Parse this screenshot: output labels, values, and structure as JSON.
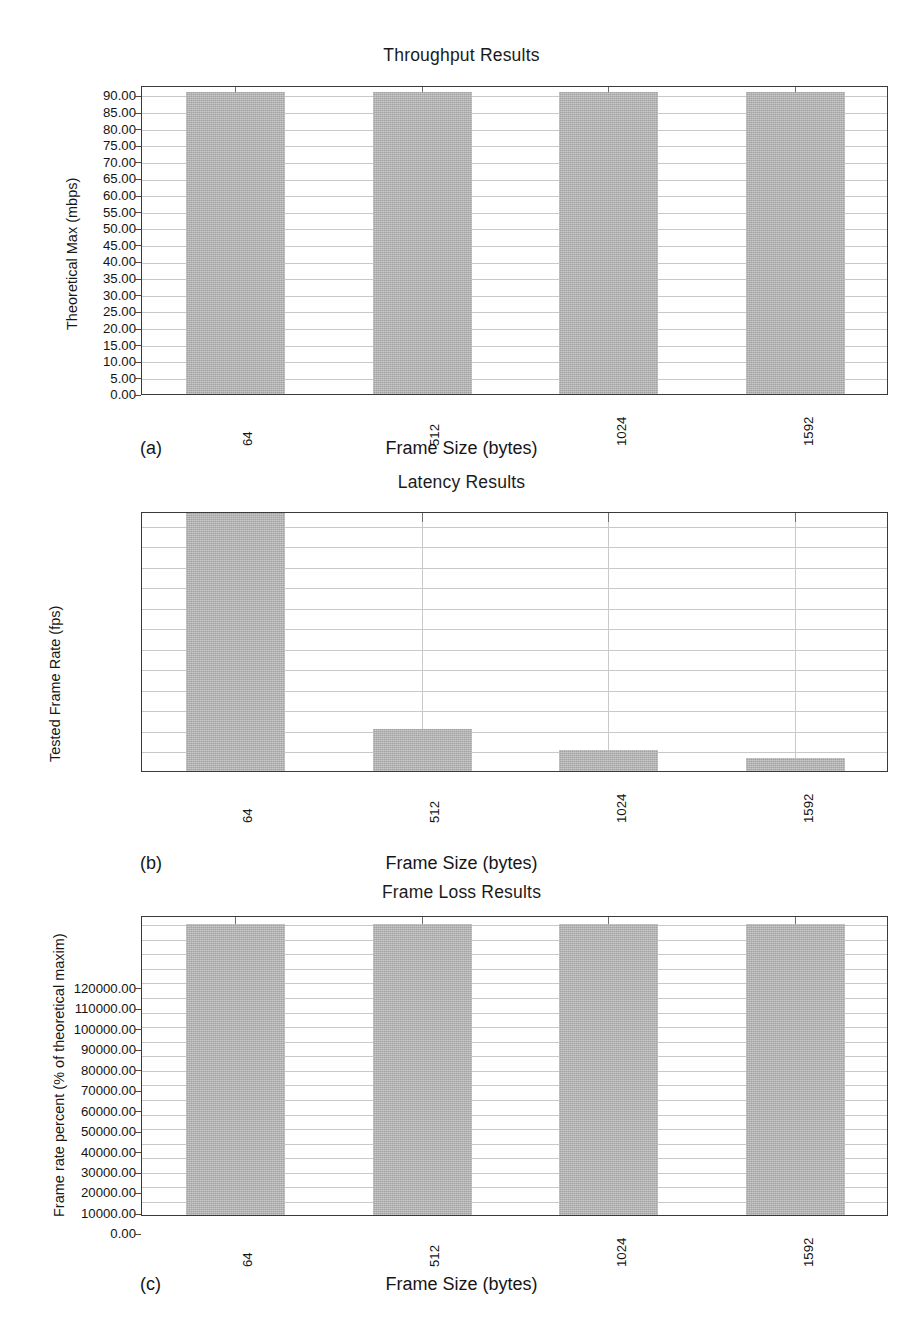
{
  "figure": {
    "background": "#ffffff",
    "bar_color": "#b4b4b4",
    "frame_color": "#3a3a3a",
    "grid_color": "#c9c9c9"
  },
  "panels": [
    {
      "letter": "(a)",
      "title": "Throughput Results",
      "ylabel": "Theoretical Max (mbps)",
      "xlabel": "Frame Size (bytes)",
      "ytickvals": [
        "0.00",
        "5.00",
        "10.00",
        "15.00",
        "20.00",
        "25.00",
        "30.00",
        "35.00",
        "40.00",
        "45.00",
        "50.00",
        "55.00",
        "60.00",
        "65.00",
        "70.00",
        "75.00",
        "80.00",
        "85.00",
        "90.00"
      ],
      "xticks": [
        "64",
        "512",
        "1024",
        "1592"
      ]
    },
    {
      "letter": "(b)",
      "title": "Latency Results",
      "ylabel": "Tested Frame Rate (fps)",
      "xlabel": "Frame Size (bytes)",
      "ytickvals": [
        "0.00",
        "10000.00",
        "20000.00",
        "30000.00",
        "40000.00",
        "50000.00",
        "60000.00",
        "70000.00",
        "80000.00",
        "90000.00",
        "100000.00",
        "110000.00",
        "120000.00"
      ],
      "xticks": [
        "64",
        "512",
        "1024",
        "1592"
      ]
    },
    {
      "letter": "(c)",
      "title": "Frame Loss Results",
      "ylabel": "Frame rate percent (% of theoretical maxim)",
      "xlabel": "Frame Size (bytes)",
      "ytickvals": [
        "0.00",
        "5.00",
        "10.00",
        "15.00",
        "20.00",
        "25.00",
        "30.00",
        "35.00",
        "40.00",
        "45.00",
        "50.00",
        "55.00",
        "60.00",
        "65.00",
        "70.00",
        "75.00",
        "80.00",
        "85.00",
        "90.00",
        "95.00",
        "100.00"
      ],
      "xticks": [
        "64",
        "512",
        "1024",
        "1592"
      ]
    }
  ],
  "chart_data": [
    {
      "type": "bar",
      "panel": "(a)",
      "title": "Throughput Results",
      "xlabel": "Frame Size (bytes)",
      "ylabel": "Theoretical Max (mbps)",
      "categories": [
        "64",
        "512",
        "1024",
        "1592"
      ],
      "values": [
        91.0,
        91.0,
        91.0,
        91.0
      ],
      "ylim": [
        0,
        93
      ],
      "ytick_step": 5,
      "yticks": [
        0,
        5,
        10,
        15,
        20,
        25,
        30,
        35,
        40,
        45,
        50,
        55,
        60,
        65,
        70,
        75,
        80,
        85,
        90
      ],
      "tick_format": "0.00",
      "grid": true,
      "legend": null
    },
    {
      "type": "bar",
      "panel": "(b)",
      "title": "Latency Results",
      "xlabel": "Frame Size (bytes)",
      "ylabel": "Tested Frame Rate (fps)",
      "categories": [
        "64",
        "512",
        "1024",
        "1592"
      ],
      "values": [
        148800,
        20600,
        10500,
        6600
      ],
      "ylim": [
        0,
        127000
      ],
      "ytick_step": 10000,
      "yticks": [
        0,
        10000,
        20000,
        30000,
        40000,
        50000,
        60000,
        70000,
        80000,
        90000,
        100000,
        110000,
        120000
      ],
      "tick_format": "0.00",
      "grid": true,
      "note": "first bar is clipped at the top of the axis",
      "legend": null
    },
    {
      "type": "bar",
      "panel": "(c)",
      "title": "Frame Loss Results",
      "xlabel": "Frame Size (bytes)",
      "ylabel": "Frame rate percent (% of theoretical maxim)",
      "categories": [
        "64",
        "512",
        "1024",
        "1592"
      ],
      "values": [
        100.0,
        100.0,
        100.0,
        100.0
      ],
      "ylim": [
        0,
        103
      ],
      "ytick_step": 5,
      "yticks": [
        0,
        5,
        10,
        15,
        20,
        25,
        30,
        35,
        40,
        45,
        50,
        55,
        60,
        65,
        70,
        75,
        80,
        85,
        90,
        95,
        100
      ],
      "tick_format": "0.00",
      "grid": true,
      "legend": null
    }
  ]
}
